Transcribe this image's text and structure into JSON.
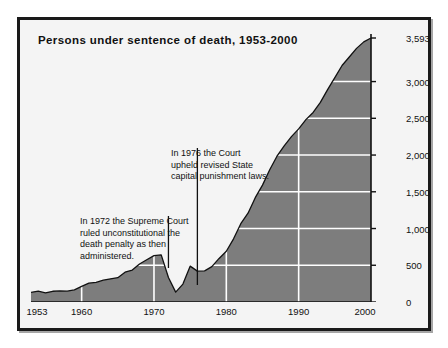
{
  "figure": {
    "title": "Persons under sentence of death, 1953-2000",
    "frame_color": "#1a1a1a",
    "background_color": "#f4f4f4"
  },
  "annotations": [
    {
      "name": "annotation-1976",
      "lines": [
        "In 1976 the Court",
        "upheld revised State",
        "capital punishment laws."
      ],
      "points_to_year": 1976
    },
    {
      "name": "annotation-1972",
      "lines": [
        "In 1972 the Supreme Court",
        "ruled unconstitutional the",
        "death penalty as then",
        "administered."
      ],
      "points_to_year": 1972
    }
  ],
  "chart_data": {
    "type": "area",
    "title": "Persons under sentence of death, 1953-2000",
    "xlabel": "",
    "ylabel": "",
    "xlim": [
      1953,
      2000
    ],
    "ylim": [
      0,
      3593
    ],
    "grid": true,
    "legend": null,
    "fill_color": "#7d7d7d",
    "line_color": "#111111",
    "grid_color": "#ffffff",
    "ytick_labels": [
      "0",
      "500",
      "1,000",
      "1,500",
      "2,000",
      "2,500",
      "3,000",
      "3,593"
    ],
    "ytick_values": [
      0,
      500,
      1000,
      1500,
      2000,
      2500,
      3000,
      3593
    ],
    "xtick_labels": [
      "1953",
      "1960",
      "1970",
      "1980",
      "1990",
      "2000"
    ],
    "xtick_values": [
      1953,
      1960,
      1970,
      1980,
      1990,
      2000
    ],
    "x": [
      1953,
      1954,
      1955,
      1956,
      1957,
      1958,
      1959,
      1960,
      1961,
      1962,
      1963,
      1964,
      1965,
      1966,
      1967,
      1968,
      1969,
      1970,
      1971,
      1972,
      1973,
      1974,
      1975,
      1976,
      1977,
      1978,
      1979,
      1980,
      1981,
      1982,
      1983,
      1984,
      1985,
      1986,
      1987,
      1988,
      1989,
      1990,
      1991,
      1992,
      1993,
      1994,
      1995,
      1996,
      1997,
      1998,
      1999,
      2000
    ],
    "values": [
      131,
      147,
      125,
      146,
      151,
      147,
      164,
      212,
      257,
      267,
      297,
      315,
      331,
      406,
      435,
      517,
      575,
      631,
      642,
      334,
      134,
      244,
      488,
      420,
      423,
      482,
      593,
      691,
      860,
      1066,
      1209,
      1420,
      1591,
      1800,
      1984,
      2124,
      2250,
      2356,
      2482,
      2580,
      2716,
      2890,
      3054,
      3219,
      3335,
      3452,
      3540,
      3593
    ]
  }
}
